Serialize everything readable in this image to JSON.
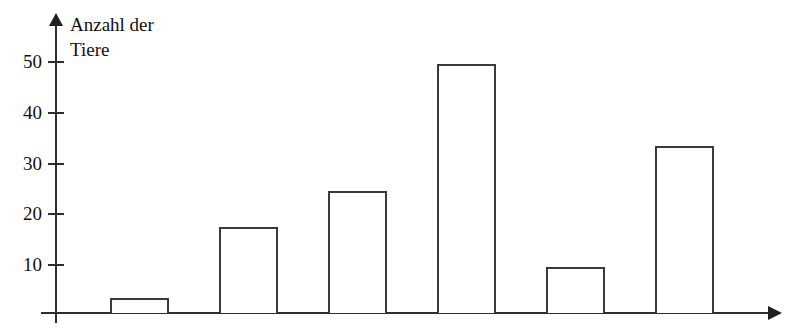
{
  "figure": {
    "title_remnant": "",
    "background": "#ffffff",
    "line_color": "#2e2e2e",
    "bar_border_color": "#3a3a3a",
    "bar_fill_color": "#ffffff"
  },
  "axes": {
    "y_caption": "Anzahl der\nTiere",
    "y_ticks": [
      "10",
      "20",
      "30",
      "40",
      "50"
    ],
    "y_arrow": "arrow-up-icon",
    "x_arrow": "arrow-right-icon",
    "x_ticks": []
  },
  "chart_data": {
    "type": "bar",
    "title": "",
    "subtitle": "",
    "xlabel": "",
    "ylabel": "Anzahl der Tiere",
    "categories": [
      "1",
      "2",
      "3",
      "4",
      "5",
      "6"
    ],
    "values": [
      3,
      17,
      24,
      49,
      9,
      33
    ],
    "series": [
      {
        "name": "Anzahl der Tiere",
        "values": [
          3,
          17,
          24,
          49,
          9,
          33
        ]
      }
    ],
    "ylim": [
      0,
      55
    ],
    "ytick_values": [
      10,
      20,
      30,
      40,
      50
    ],
    "grid": false,
    "legend": false,
    "legend_position": "none",
    "bar_style": "outline",
    "annotations": []
  }
}
